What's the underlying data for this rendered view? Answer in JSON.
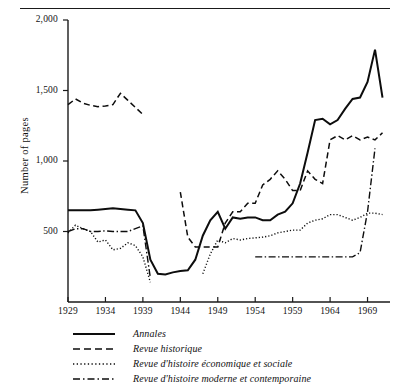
{
  "chart_data": {
    "type": "line",
    "title": "",
    "xlabel": "",
    "ylabel": "Number of pages",
    "xlim": [
      1929,
      1972
    ],
    "ylim": [
      0,
      2000
    ],
    "grid": false,
    "legend_position": "below",
    "y_ticks": [
      "500",
      "1,000",
      "1,500",
      "2,000"
    ],
    "y_tick_values": [
      500,
      1000,
      1500,
      2000
    ],
    "x_ticks": [
      "1929",
      "1934",
      "1939",
      "1944",
      "1949",
      "1954",
      "1959",
      "1964",
      "1969"
    ],
    "x_tick_values": [
      1929,
      1934,
      1939,
      1944,
      1949,
      1954,
      1959,
      1964,
      1969
    ],
    "series": [
      {
        "name": "Annales",
        "style": "solid",
        "x": [
          1929,
          1930,
          1931,
          1932,
          1933,
          1934,
          1935,
          1936,
          1937,
          1938,
          1939,
          1940,
          1941,
          1942,
          1943,
          1944,
          1945,
          1946,
          1947,
          1948,
          1949,
          1950,
          1951,
          1952,
          1953,
          1954,
          1955,
          1956,
          1957,
          1958,
          1959,
          1960,
          1961,
          1962,
          1963,
          1964,
          1965,
          1966,
          1967,
          1968,
          1969,
          1970,
          1971
        ],
        "values": [
          650,
          650,
          650,
          650,
          655,
          660,
          665,
          660,
          655,
          650,
          560,
          300,
          200,
          195,
          210,
          220,
          225,
          300,
          470,
          580,
          640,
          520,
          600,
          590,
          600,
          600,
          580,
          580,
          620,
          640,
          700,
          840,
          1060,
          1290,
          1300,
          1260,
          1290,
          1370,
          1440,
          1450,
          1560,
          1790,
          1450
        ]
      },
      {
        "name": "Revue historique",
        "style": "dashed",
        "x": [
          1929,
          1930,
          1931,
          1932,
          1933,
          1934,
          1935,
          1936,
          1937,
          1938,
          1939,
          1944,
          1945,
          1946,
          1947,
          1948,
          1949,
          1950,
          1951,
          1952,
          1953,
          1954,
          1955,
          1956,
          1957,
          1958,
          1959,
          1960,
          1961,
          1962,
          1963,
          1964,
          1965,
          1966,
          1967,
          1968,
          1969,
          1970,
          1971
        ],
        "values": [
          1400,
          1440,
          1410,
          1395,
          1385,
          1390,
          1400,
          1480,
          1430,
          1380,
          1330,
          780,
          460,
          390,
          390,
          390,
          390,
          560,
          640,
          640,
          700,
          700,
          830,
          870,
          930,
          870,
          790,
          790,
          930,
          870,
          840,
          1150,
          1180,
          1150,
          1180,
          1150,
          1170,
          1150,
          1200
        ],
        "gaps": [
          [
            1939,
            1944
          ]
        ]
      },
      {
        "name": "Revue d'histoire économique et sociale",
        "style": "dotted",
        "x": [
          1929,
          1930,
          1931,
          1932,
          1933,
          1934,
          1935,
          1936,
          1937,
          1938,
          1939,
          1940,
          1947,
          1948,
          1949,
          1950,
          1951,
          1952,
          1953,
          1954,
          1955,
          1956,
          1957,
          1958,
          1959,
          1960,
          1961,
          1962,
          1963,
          1964,
          1965,
          1966,
          1967,
          1968,
          1969,
          1970,
          1971
        ],
        "values": [
          490,
          545,
          520,
          500,
          425,
          440,
          370,
          380,
          420,
          400,
          320,
          140,
          200,
          340,
          440,
          420,
          450,
          440,
          450,
          455,
          460,
          470,
          490,
          500,
          510,
          510,
          560,
          580,
          590,
          620,
          620,
          600,
          580,
          600,
          630,
          630,
          620
        ],
        "gaps": [
          [
            1940,
            1947
          ]
        ]
      },
      {
        "name": "Revue d'histoire moderne et contemporaine",
        "style": "dashdot",
        "x": [
          1929,
          1930,
          1931,
          1932,
          1933,
          1934,
          1935,
          1936,
          1937,
          1938,
          1939,
          1940,
          1954,
          1955,
          1956,
          1957,
          1958,
          1959,
          1960,
          1961,
          1962,
          1963,
          1964,
          1965,
          1966,
          1967,
          1968,
          1969,
          1970
        ],
        "values": [
          500,
          520,
          520,
          500,
          500,
          505,
          500,
          500,
          500,
          520,
          540,
          170,
          320,
          320,
          320,
          320,
          320,
          320,
          320,
          320,
          320,
          320,
          320,
          320,
          320,
          320,
          350,
          640,
          1090
        ],
        "gaps": [
          [
            1940,
            1954
          ]
        ]
      }
    ]
  },
  "axis": {
    "y_title": "Number of pages"
  },
  "legend": {
    "items": [
      {
        "label": "Annales",
        "style": "solid"
      },
      {
        "label": "Revue historique",
        "style": "dashed"
      },
      {
        "label": "Revue d'histoire économique et sociale",
        "style": "dotted"
      },
      {
        "label": "Revue d'histoire moderne et contemporaine",
        "style": "dashdot"
      }
    ]
  },
  "colors": {
    "ink": "#0d0d0d",
    "background": "#ffffff"
  }
}
